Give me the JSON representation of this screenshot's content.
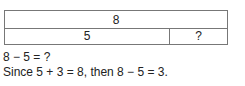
{
  "bar_model": {
    "whole": "8",
    "part_known": "5",
    "part_unknown": "?"
  },
  "text": {
    "question": "8 − 5 = ?",
    "explanation": "Since 5 + 3 = 8, then 8 − 5 = 3."
  }
}
